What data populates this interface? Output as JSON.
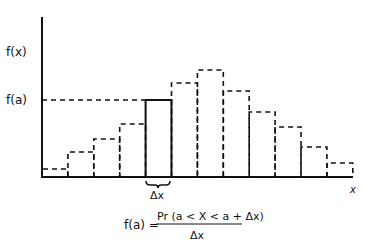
{
  "diagram": {
    "y_label": "f(x)",
    "x_label": "x",
    "level_label": "f(a)",
    "delta_label": "Δx",
    "formula": {
      "lhs": "f(a) =",
      "numerator": "Pr (a < X < a + Δx)",
      "denominator": "Δx"
    }
  },
  "chart_data": {
    "type": "bar",
    "title": "",
    "xlabel": "x",
    "ylabel": "f(x)",
    "categories": [
      "1",
      "2",
      "3",
      "4",
      "a",
      "6",
      "7",
      "8",
      "9",
      "10",
      "11",
      "12"
    ],
    "values": [
      8,
      25,
      38,
      53,
      77,
      94,
      107,
      86,
      65,
      50,
      30,
      14
    ],
    "highlighted_index": 4,
    "highlight_style": "solid",
    "other_style": "dashed",
    "reference_line": {
      "label": "f(a)",
      "value": 77,
      "style": "dashed"
    },
    "annotation": "Δx (width of highlighted bar)"
  }
}
